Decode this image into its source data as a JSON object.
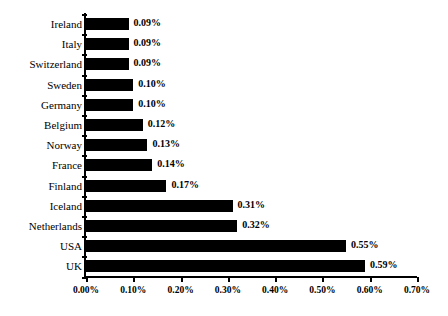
{
  "chart_data": {
    "type": "bar",
    "orientation": "horizontal",
    "title": "",
    "subtitle": "",
    "xlabel": "",
    "ylabel": "",
    "xlim": [
      0.0,
      0.7
    ],
    "grid": false,
    "legend": null,
    "categories": [
      "Ireland",
      "Italy",
      "Switzerland",
      "Sweden",
      "Germany",
      "Belgium",
      "Norway",
      "France",
      "Finland",
      "Iceland",
      "Netherlands",
      "USA",
      "UK"
    ],
    "values": [
      0.09,
      0.09,
      0.09,
      0.1,
      0.1,
      0.12,
      0.13,
      0.14,
      0.17,
      0.31,
      0.32,
      0.55,
      0.59
    ],
    "data_labels": [
      "0.09%",
      "0.09%",
      "0.09%",
      "0.10%",
      "0.10%",
      "0.12%",
      "0.13%",
      "0.14%",
      "0.17%",
      "0.31%",
      "0.32%",
      "0.55%",
      "0.59%"
    ],
    "xticks": [
      0.0,
      0.1,
      0.2,
      0.3,
      0.4,
      0.5,
      0.6,
      0.7
    ],
    "xtick_labels": [
      "0.00%",
      "0.10%",
      "0.20%",
      "0.30%",
      "0.40%",
      "0.50%",
      "0.60%",
      "0.70%"
    ],
    "bar_color": "#000000",
    "background_color": "#FFFFFF",
    "axis_color": "#000000"
  }
}
